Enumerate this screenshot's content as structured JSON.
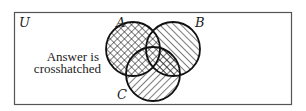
{
  "diagram": {
    "type": "venn",
    "universe_label": "U",
    "sets": [
      {
        "label": "A",
        "cx": 133,
        "cy": 49,
        "r": 27,
        "label_x": 116,
        "label_y": 26
      },
      {
        "label": "B",
        "cx": 173,
        "cy": 49,
        "r": 27,
        "label_x": 196,
        "label_y": 26
      },
      {
        "label": "C",
        "cx": 153,
        "cy": 74,
        "r": 27,
        "label_x": 118,
        "label_y": 99
      }
    ],
    "annotation": {
      "line1": "Answer is",
      "line2": "crosshatched"
    },
    "shading": {
      "A": "crosshatch",
      "B": "hatch-backslash",
      "C": "hatch-slash",
      "B_and_C": "crosshatch",
      "answer_region": "A ∪ (B ∩ C)"
    },
    "colors": {
      "stroke": "#111111",
      "frame": "#555555",
      "background": "#ffffff"
    }
  }
}
